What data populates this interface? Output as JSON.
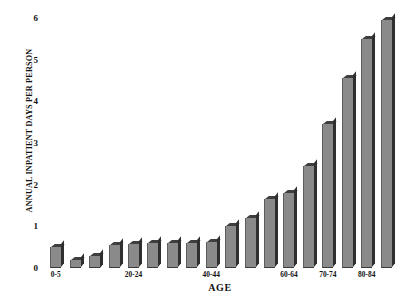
{
  "chart_data": {
    "type": "bar",
    "title": "",
    "xlabel": "AGE",
    "ylabel": "ANNUAL INPATIENT DAYS PER PERSON",
    "ylim": [
      0,
      6
    ],
    "ytick_labels": [
      "0",
      "1",
      "2",
      "3",
      "4",
      "5",
      "6"
    ],
    "ytick_values": [
      0,
      1,
      2,
      3,
      4,
      5,
      6
    ],
    "grid": false,
    "legend": null,
    "categories": [
      "0-5",
      "5-9",
      "10-14",
      "15-19",
      "20-24",
      "25-29",
      "30-34",
      "35-39",
      "40-44",
      "45-49",
      "50-54",
      "55-59",
      "60-64",
      "65-69",
      "70-74",
      "75-79",
      "80-84",
      "85+"
    ],
    "values": [
      0.5,
      0.2,
      0.3,
      0.55,
      0.58,
      0.6,
      0.6,
      0.6,
      0.62,
      1.0,
      1.2,
      1.65,
      1.8,
      2.45,
      3.45,
      4.55,
      5.5,
      5.95
    ],
    "visible_xtick_labels": [
      {
        "label": "0-5",
        "index": 0
      },
      {
        "label": "20-24",
        "index": 4
      },
      {
        "label": "40-44",
        "index": 8
      },
      {
        "label": "60-64",
        "index": 12
      },
      {
        "label": "70-74",
        "index": 14
      },
      {
        "label": "80-84",
        "index": 16
      }
    ],
    "bar_face_color": "#8a8a8a",
    "bar_top_color": "#3e3e3e",
    "bar_side_color": "#2f2f2f"
  }
}
